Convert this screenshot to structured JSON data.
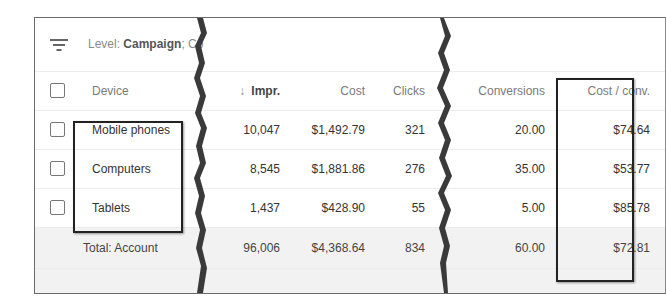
{
  "filter": {
    "icon": "filter-icon",
    "prefix": "Level: ",
    "level": "Campaign",
    "suffix": "; Co"
  },
  "table": {
    "columns": {
      "device": "Device",
      "sort_icon": "↓",
      "impr": "Impr.",
      "cost": "Cost",
      "clicks": "Clicks",
      "conversions": "Conversions",
      "cost_per_conv": "Cost / conv."
    },
    "rows": [
      {
        "device": "Mobile phones",
        "impr": "10,047",
        "cost": "$1,492.79",
        "clicks": "321",
        "conversions": "20.00",
        "cost_per_conv": "$74.64"
      },
      {
        "device": "Computers",
        "impr": "8,545",
        "cost": "$1,881.86",
        "clicks": "276",
        "conversions": "35.00",
        "cost_per_conv": "$53.77"
      },
      {
        "device": "Tablets",
        "impr": "1,437",
        "cost": "$428.90",
        "clicks": "55",
        "conversions": "5.00",
        "cost_per_conv": "$85.78"
      }
    ],
    "total": {
      "label": "Total: Account",
      "impr": "96,006",
      "cost": "$4,368.64",
      "clicks": "834",
      "conversions": "60.00",
      "cost_per_conv": "$72.81"
    }
  }
}
